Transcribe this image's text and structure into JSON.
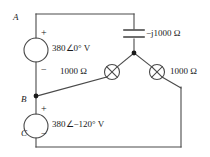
{
  "diagram": {
    "type": "electrical-schematic",
    "stroke_color": "#4a4a4a",
    "text_color": "#1a1a1a"
  },
  "nodes": {
    "a": "A",
    "b": "B",
    "c": "C"
  },
  "sources": [
    {
      "id": "source-ab",
      "label": "380∠0° V",
      "plus": "+",
      "minus": "−",
      "between": "A-B"
    },
    {
      "id": "source-bc",
      "label": "380∠−120° V",
      "plus": "+",
      "minus": "−",
      "between": "B-C"
    }
  ],
  "components": [
    {
      "id": "capacitor-top",
      "symbol": "capacitor",
      "label": "−j1000 Ω"
    },
    {
      "id": "resistor-left",
      "symbol": "crossed-circle",
      "label": "1000 Ω"
    },
    {
      "id": "resistor-right",
      "symbol": "crossed-circle",
      "label": "1000 Ω"
    }
  ]
}
